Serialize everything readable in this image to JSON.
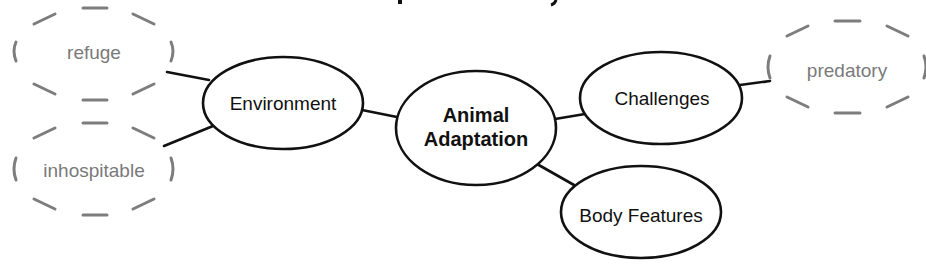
{
  "diagram": {
    "type": "concept-map",
    "colors": {
      "node_stroke": "#111111",
      "node_text": "#111111",
      "vocab_stroke": "#7d7d7d",
      "vocab_text": "#7a7a7a",
      "background": "#ffffff"
    },
    "center": {
      "line1": "Animal",
      "line2": "Adaptation"
    },
    "nodes": {
      "environment": "Environment",
      "challenges": "Challenges",
      "body_features": "Body Features"
    },
    "vocabulary": {
      "refuge": "refuge",
      "inhospitable": "inhospitable",
      "predatory": "predatory"
    }
  }
}
